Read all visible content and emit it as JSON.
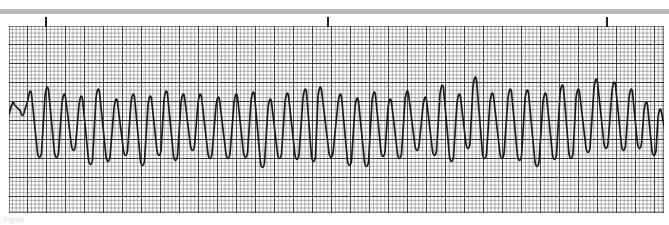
{
  "strip": {
    "type": "ecg-rhythm-strip",
    "grid": {
      "minor_px": 3.8,
      "major_px": 19,
      "line_color": "#1a1a1a",
      "background": "#ffffff"
    },
    "time_markers_x": [
      45,
      327,
      606
    ],
    "top_bar_color": "#b9b9b9",
    "trace_color": "#1a1a1a"
  },
  "chart_data": {
    "type": "line",
    "title": "",
    "xlabel": "",
    "ylabel": "",
    "grid": true,
    "peaks": [
      {
        "x": 13,
        "top": 103,
        "bottom": 115
      },
      {
        "x": 30,
        "top": 92,
        "bottom": 157
      },
      {
        "x": 47,
        "top": 88,
        "bottom": 157
      },
      {
        "x": 64,
        "top": 95,
        "bottom": 150
      },
      {
        "x": 81,
        "top": 97,
        "bottom": 164
      },
      {
        "x": 98,
        "top": 90,
        "bottom": 161
      },
      {
        "x": 116,
        "top": 100,
        "bottom": 155
      },
      {
        "x": 133,
        "top": 95,
        "bottom": 165
      },
      {
        "x": 150,
        "top": 97,
        "bottom": 155
      },
      {
        "x": 166,
        "top": 92,
        "bottom": 160
      },
      {
        "x": 183,
        "top": 95,
        "bottom": 150
      },
      {
        "x": 200,
        "top": 95,
        "bottom": 158
      },
      {
        "x": 218,
        "top": 98,
        "bottom": 158
      },
      {
        "x": 236,
        "top": 95,
        "bottom": 157
      },
      {
        "x": 253,
        "top": 93,
        "bottom": 167
      },
      {
        "x": 270,
        "top": 100,
        "bottom": 158
      },
      {
        "x": 287,
        "top": 94,
        "bottom": 159
      },
      {
        "x": 305,
        "top": 90,
        "bottom": 161
      },
      {
        "x": 320,
        "top": 88,
        "bottom": 157
      },
      {
        "x": 340,
        "top": 95,
        "bottom": 165
      },
      {
        "x": 357,
        "top": 99,
        "bottom": 166
      },
      {
        "x": 374,
        "top": 93,
        "bottom": 156
      },
      {
        "x": 390,
        "top": 100,
        "bottom": 158
      },
      {
        "x": 407,
        "top": 92,
        "bottom": 150
      },
      {
        "x": 425,
        "top": 98,
        "bottom": 155
      },
      {
        "x": 442,
        "top": 86,
        "bottom": 161
      },
      {
        "x": 459,
        "top": 95,
        "bottom": 148
      },
      {
        "x": 475,
        "top": 78,
        "bottom": 158
      },
      {
        "x": 492,
        "top": 94,
        "bottom": 158
      },
      {
        "x": 510,
        "top": 90,
        "bottom": 160
      },
      {
        "x": 527,
        "top": 91,
        "bottom": 166
      },
      {
        "x": 545,
        "top": 94,
        "bottom": 159
      },
      {
        "x": 562,
        "top": 86,
        "bottom": 158
      },
      {
        "x": 578,
        "top": 90,
        "bottom": 152
      },
      {
        "x": 596,
        "top": 80,
        "bottom": 148
      },
      {
        "x": 614,
        "top": 83,
        "bottom": 150
      },
      {
        "x": 631,
        "top": 90,
        "bottom": 148
      },
      {
        "x": 646,
        "top": 103,
        "bottom": 155
      },
      {
        "x": 660,
        "top": 110,
        "bottom": 140
      }
    ]
  },
  "caption": "Figure"
}
